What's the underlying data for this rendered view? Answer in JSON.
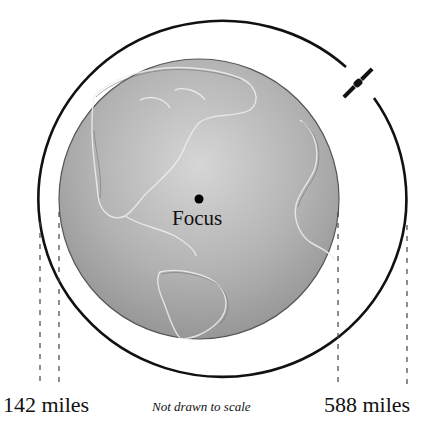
{
  "diagram": {
    "focus_label": "Focus",
    "perigee_label": "142 miles",
    "apogee_label": "588 miles",
    "scale_note": "Not drawn to scale",
    "colors": {
      "globe_fill": "#a8a8a8",
      "globe_highlight": "#d4d4d4",
      "orbit_stroke": "#111111",
      "dash_stroke": "#444444"
    },
    "elements": [
      "earth-globe",
      "orbit-ellipse",
      "satellite",
      "focus-point",
      "distance-guides"
    ]
  }
}
